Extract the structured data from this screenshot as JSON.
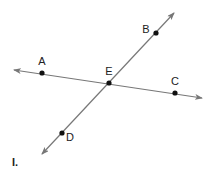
{
  "caption": "I.",
  "colors": {
    "line": "#777777",
    "point": "#111111",
    "text": "#222222"
  },
  "lines": [
    {
      "name": "line-AC",
      "from": [
        14,
        70
      ],
      "to": [
        202,
        98
      ]
    },
    {
      "name": "line-BD",
      "from": [
        174,
        13
      ],
      "to": [
        42,
        154
      ]
    }
  ],
  "points": [
    {
      "label": "A",
      "x": 42,
      "y": 73,
      "lx": 42,
      "ly": 65
    },
    {
      "label": "B",
      "x": 156,
      "y": 33,
      "lx": 146,
      "ly": 33
    },
    {
      "label": "E",
      "x": 109,
      "y": 83,
      "lx": 109,
      "ly": 75
    },
    {
      "label": "C",
      "x": 175,
      "y": 93,
      "lx": 175,
      "ly": 85
    },
    {
      "label": "D",
      "x": 62,
      "y": 133,
      "lx": 70,
      "ly": 141
    }
  ]
}
